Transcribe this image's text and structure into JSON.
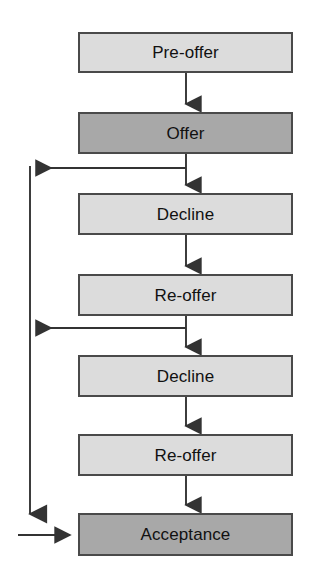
{
  "diagram": {
    "type": "flowchart",
    "background_color": "#ffffff",
    "colors": {
      "light_node_fill": "#dcdcdc",
      "dark_node_fill": "#a8a8a8",
      "node_border": "#4a4a4a",
      "connector": "#333333",
      "label_text": "#111111"
    },
    "nodes": [
      {
        "id": "pre-offer",
        "label": "Pre-offer",
        "style": "light",
        "x": 78,
        "y": 32,
        "w": 215,
        "h": 41
      },
      {
        "id": "offer",
        "label": "Offer",
        "style": "dark",
        "x": 78,
        "y": 112,
        "w": 215,
        "h": 42
      },
      {
        "id": "decline-1",
        "label": "Decline",
        "style": "light",
        "x": 78,
        "y": 193,
        "w": 215,
        "h": 42
      },
      {
        "id": "re-offer-1",
        "label": "Re-offer",
        "style": "light",
        "x": 78,
        "y": 274,
        "w": 215,
        "h": 42
      },
      {
        "id": "decline-2",
        "label": "Decline",
        "style": "light",
        "x": 78,
        "y": 355,
        "w": 215,
        "h": 42
      },
      {
        "id": "re-offer-2",
        "label": "Re-offer",
        "style": "light",
        "x": 78,
        "y": 434,
        "w": 215,
        "h": 42
      },
      {
        "id": "acceptance",
        "label": "Acceptance",
        "style": "dark",
        "x": 78,
        "y": 513,
        "w": 215,
        "h": 43
      }
    ],
    "edges": [
      {
        "id": "e-pre-offer-to-offer",
        "from": "pre-offer",
        "to": "offer",
        "kind": "down"
      },
      {
        "id": "e-offer-to-decline-1",
        "from": "offer",
        "to": "decline-1",
        "kind": "down"
      },
      {
        "id": "e-decline-1-to-re-offer-1",
        "from": "decline-1",
        "to": "re-offer-1",
        "kind": "down"
      },
      {
        "id": "e-re-offer-1-to-decline-2",
        "from": "re-offer-1",
        "to": "decline-2",
        "kind": "down"
      },
      {
        "id": "e-decline-2-to-re-offer-2",
        "from": "decline-2",
        "to": "re-offer-2",
        "kind": "down"
      },
      {
        "id": "e-re-offer-2-to-acceptance",
        "from": "re-offer-2",
        "to": "acceptance",
        "kind": "down"
      },
      {
        "id": "e-offer-to-rail",
        "from": "offer",
        "to": "feedback-rail",
        "kind": "left-branch"
      },
      {
        "id": "e-re-offer-1-to-rail",
        "from": "re-offer-1",
        "to": "feedback-rail",
        "kind": "left-branch"
      },
      {
        "id": "e-rail-to-acceptance",
        "from": "feedback-rail",
        "to": "acceptance",
        "kind": "rail-to-right"
      }
    ]
  }
}
